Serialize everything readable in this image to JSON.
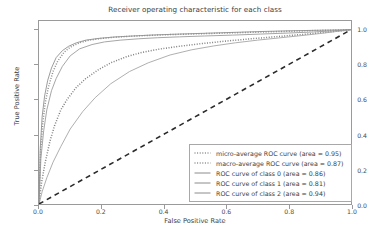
{
  "chart_data": {
    "type": "line",
    "title": "Receiver operating characteristic for each class",
    "xlabel": "False Positive Rate",
    "ylabel": "True Positive Rate",
    "xlim": [
      0.0,
      1.0
    ],
    "ylim": [
      0.0,
      1.05
    ],
    "grid": false,
    "legend_position": "lower right",
    "xticks": [
      "0.0",
      "0.2",
      "0.4",
      "0.6",
      "0.8",
      "1.0"
    ],
    "xtick_values": [
      0.0,
      0.2,
      0.4,
      0.6,
      0.8,
      1.0
    ],
    "yticks": [
      "0.0",
      "0.2",
      "0.4",
      "0.6",
      "0.8",
      "1.0"
    ],
    "ytick_values": [
      0.0,
      0.2,
      0.4,
      0.6,
      0.8,
      1.0
    ],
    "series": [
      {
        "name": "micro-average ROC curve (area = 0.95)",
        "area": 0.95,
        "style": "dotted",
        "color": "#8c8c8c",
        "x": [
          0.0,
          0.005,
          0.012,
          0.02,
          0.03,
          0.045,
          0.06,
          0.08,
          0.1,
          0.13,
          0.16,
          0.2,
          0.25,
          0.3,
          0.36,
          0.42,
          0.5,
          0.58,
          0.66,
          0.74,
          0.82,
          0.9,
          1.0
        ],
        "y": [
          0.0,
          0.3,
          0.46,
          0.58,
          0.67,
          0.76,
          0.82,
          0.87,
          0.9,
          0.925,
          0.94,
          0.95,
          0.958,
          0.963,
          0.968,
          0.972,
          0.976,
          0.98,
          0.984,
          0.988,
          0.992,
          0.996,
          1.0
        ]
      },
      {
        "name": "macro-average ROC curve (area = 0.87)",
        "area": 0.87,
        "style": "dotted",
        "color": "#7f7f7f",
        "x": [
          0.0,
          0.008,
          0.02,
          0.035,
          0.05,
          0.07,
          0.09,
          0.12,
          0.15,
          0.19,
          0.23,
          0.28,
          0.33,
          0.39,
          0.45,
          0.52,
          0.6,
          0.68,
          0.76,
          0.84,
          0.92,
          1.0
        ],
        "y": [
          0.0,
          0.12,
          0.24,
          0.36,
          0.45,
          0.54,
          0.6,
          0.67,
          0.72,
          0.77,
          0.81,
          0.845,
          0.87,
          0.89,
          0.905,
          0.92,
          0.935,
          0.948,
          0.96,
          0.972,
          0.985,
          1.0
        ]
      },
      {
        "name": "ROC curve of class 0 (area = 0.86)",
        "area": 0.86,
        "style": "solid",
        "color": "#9b9b9b",
        "x": [
          0.0,
          0.006,
          0.015,
          0.025,
          0.04,
          0.055,
          0.075,
          0.1,
          0.13,
          0.17,
          0.21,
          0.26,
          0.32,
          0.38,
          0.45,
          0.53,
          0.62,
          0.71,
          0.8,
          0.88,
          0.94,
          1.0
        ],
        "y": [
          0.0,
          0.26,
          0.42,
          0.54,
          0.65,
          0.72,
          0.79,
          0.85,
          0.89,
          0.915,
          0.93,
          0.94,
          0.948,
          0.954,
          0.959,
          0.964,
          0.969,
          0.975,
          0.981,
          0.987,
          0.993,
          1.0
        ]
      },
      {
        "name": "ROC curve of class 1 (area = 0.81)",
        "area": 0.81,
        "style": "solid",
        "color": "#a5a5a5",
        "x": [
          0.0,
          0.01,
          0.025,
          0.045,
          0.07,
          0.1,
          0.14,
          0.18,
          0.23,
          0.29,
          0.35,
          0.42,
          0.49,
          0.56,
          0.63,
          0.7,
          0.77,
          0.84,
          0.9,
          0.95,
          1.0
        ],
        "y": [
          0.0,
          0.07,
          0.15,
          0.24,
          0.33,
          0.43,
          0.53,
          0.61,
          0.69,
          0.76,
          0.81,
          0.855,
          0.885,
          0.907,
          0.925,
          0.94,
          0.953,
          0.966,
          0.978,
          0.989,
          1.0
        ]
      },
      {
        "name": "ROC curve of class 2 (area = 0.94)",
        "area": 0.94,
        "style": "solid",
        "color": "#909090",
        "x": [
          0.0,
          0.004,
          0.01,
          0.018,
          0.028,
          0.04,
          0.055,
          0.075,
          0.095,
          0.12,
          0.15,
          0.19,
          0.24,
          0.3,
          0.37,
          0.45,
          0.54,
          0.63,
          0.72,
          0.81,
          0.9,
          1.0
        ],
        "y": [
          0.0,
          0.32,
          0.5,
          0.62,
          0.71,
          0.78,
          0.84,
          0.88,
          0.905,
          0.925,
          0.94,
          0.95,
          0.958,
          0.964,
          0.97,
          0.975,
          0.98,
          0.985,
          0.99,
          0.994,
          0.997,
          1.0
        ]
      },
      {
        "name": "chance-diagonal",
        "style": "dashed",
        "color": "#2b2b2b",
        "x": [
          0.0,
          1.0
        ],
        "y": [
          0.0,
          1.0
        ]
      }
    ]
  },
  "legend": {
    "items": [
      {
        "label": "micro-average ROC curve (area = 0.95)",
        "style": "dotted"
      },
      {
        "label": "macro-average ROC curve (area = 0.87)",
        "style": "dotted"
      },
      {
        "label": "ROC curve of class 0 (area = 0.86)",
        "style": "solid"
      },
      {
        "label": "ROC curve of class 1 (area = 0.81)",
        "style": "solid"
      },
      {
        "label": "ROC curve of class 2 (area = 0.94)",
        "style": "solid"
      }
    ]
  }
}
